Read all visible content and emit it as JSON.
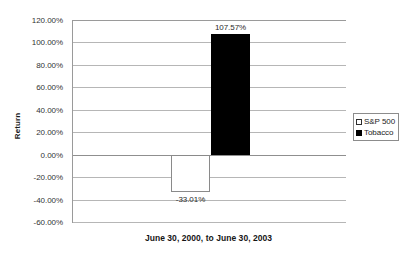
{
  "chart_data": {
    "type": "bar",
    "title": "",
    "xlabel": "June 30, 2000, to June 30, 2003",
    "ylabel": "Return",
    "categories": [
      "June 30, 2000, to June 30, 2003"
    ],
    "ylim": [
      -60,
      120
    ],
    "ytick_step": 20,
    "ytick_labels": [
      "120.00%",
      "100.00%",
      "80.00%",
      "60.00%",
      "40.00%",
      "20.00%",
      "0.00%",
      "-20.00%",
      "-40.00%",
      "-60.00%"
    ],
    "ytick_values": [
      120,
      100,
      80,
      60,
      40,
      20,
      0,
      -20,
      -40,
      -60
    ],
    "grid": true,
    "grid_axis": "y",
    "legend_position": "right",
    "series": [
      {
        "name": "S&P 500",
        "values": [
          -33.01
        ],
        "data_labels": [
          "-33.01%"
        ],
        "fill": "#ffffff",
        "edge": "#8a8a8a"
      },
      {
        "name": "Tobacco",
        "values": [
          107.57
        ],
        "data_labels": [
          "107.57%"
        ],
        "fill": "#000000",
        "edge": "#000000"
      }
    ]
  },
  "axes": {
    "y_title": "Return",
    "x_title": "June 30, 2000, to June 30, 2003"
  },
  "legend": {
    "items": [
      {
        "label": "S&P 500",
        "swatch": "hollow-square-icon"
      },
      {
        "label": "Tobacco",
        "swatch": "filled-square-icon"
      }
    ]
  },
  "labels": {
    "tobacco_value": "107.57%",
    "sp500_value": "-33.01%"
  },
  "colors": {
    "background": "#ffffff",
    "gridline": "#b6b6b6",
    "axis": "#9a9a9a",
    "text": "#2a2a2a",
    "tobacco_bar": "#000000",
    "sp500_bar": "#ffffff"
  }
}
